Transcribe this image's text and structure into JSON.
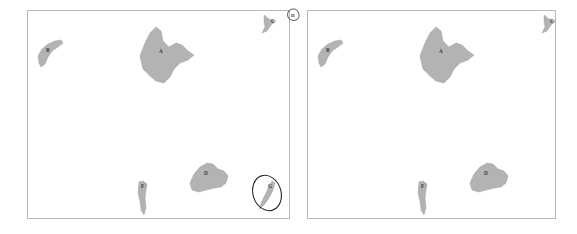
{
  "figure": {
    "type": "comparison-map-pair",
    "background_color": "#ffffff",
    "panel_border_color": "#b9b9b9",
    "polygon_fill_color": "#b3b3b3",
    "polygon_stroke_color": "#a0a0a0",
    "annotation_ink_color": "#2b2b2b"
  },
  "panels": [
    {
      "id": "left",
      "name": "left-map-panel",
      "shapes": [
        {
          "label": "B",
          "name": "region-b",
          "label_x": 18,
          "label_y": 41,
          "points": "11,52 10,45 14,38 20,33 27,30 33,29 35,32 30,36 24,40 20,46 17,53 13,56"
        },
        {
          "label": "A",
          "name": "region-a",
          "label_x": 131,
          "label_y": 42,
          "points": "115,58 112,45 117,32 122,22 128,16 133,20 135,30 141,36 148,32 154,34 160,40 166,44 160,49 152,52 146,58 142,66 136,72 128,70 121,64"
        },
        {
          "label": "C",
          "name": "region-c",
          "label_x": 243,
          "label_y": 12,
          "points": "236,4 241,8 248,10 243,14 239,20 234,22 237,16 236,10"
        },
        {
          "label": "D",
          "name": "region-d",
          "label_x": 176,
          "label_y": 164,
          "points": "164,179 162,172 166,163 172,156 179,152 185,153 190,158 196,160 200,165 198,172 193,176 186,177 178,179 171,181"
        },
        {
          "label": "F",
          "name": "region-f",
          "label_x": 113,
          "label_y": 177,
          "points": "111,171 115,170 119,173 118,179 117,187 118,196 116,204 113,199 112,190 110,182"
        },
        {
          "label": "G",
          "name": "region-g",
          "label_x": 240,
          "label_y": 177,
          "points": "244,170 247,172 245,179 241,187 236,194 231,198 234,190 238,182 241,175"
        }
      ],
      "annotations": [
        {
          "name": "circle-annotation-around-region-g",
          "type": "ellipse",
          "cx": 239,
          "cy": 182,
          "rx": 14,
          "ry": 18,
          "rotate": -18
        },
        {
          "name": "circled-marker-top-right",
          "type": "marker",
          "cx": 262,
          "cy": 5,
          "r": 5.5,
          "text": "H"
        }
      ]
    },
    {
      "id": "right",
      "name": "right-map-panel",
      "shapes": [
        {
          "label": "B",
          "name": "region-b",
          "label_x": 18,
          "label_y": 41,
          "points": "11,52 10,45 14,38 20,33 27,30 33,29 35,32 30,36 24,40 20,46 17,53 13,56"
        },
        {
          "label": "A",
          "name": "region-a",
          "label_x": 131,
          "label_y": 42,
          "points": "115,58 112,45 117,32 122,22 128,16 133,20 135,30 141,36 148,32 154,34 160,40 166,44 160,49 152,52 146,58 142,66 136,72 128,70 121,64"
        },
        {
          "label": "C",
          "name": "region-c",
          "label_x": 242,
          "label_y": 12,
          "points": "236,4 241,8 248,10 243,14 239,20 234,22 237,16 236,10"
        },
        {
          "label": "D",
          "name": "region-d",
          "label_x": 176,
          "label_y": 164,
          "points": "164,179 162,172 166,163 172,156 179,152 185,153 190,158 196,160 200,165 198,172 193,176 186,177 178,179 171,181"
        },
        {
          "label": "F",
          "name": "region-f",
          "label_x": 113,
          "label_y": 177,
          "points": "111,171 115,170 119,173 118,179 117,187 118,196 116,204 113,199 112,190 110,182"
        }
      ],
      "annotations": []
    }
  ]
}
